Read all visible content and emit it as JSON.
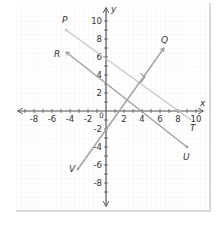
{
  "diagram": {
    "type": "coordinate-plane",
    "axes": {
      "x_label": "x",
      "y_label": "y",
      "x_range": [
        -10,
        10
      ],
      "y_range": [
        -10,
        10
      ],
      "origin_label": "0",
      "x_ticks": [
        "-8",
        "-6",
        "-4",
        "-2",
        "2",
        "4",
        "6",
        "8",
        "10"
      ],
      "y_ticks": [
        "10",
        "8",
        "6",
        "4",
        "2",
        "-2",
        "-4",
        "-6",
        "-8"
      ]
    },
    "lines": [
      {
        "name": "PT",
        "from_label": "P",
        "to_label": "T",
        "from": [
          -4.5,
          9
        ],
        "to": [
          9.5,
          -1
        ],
        "color": "#c8c8c8"
      },
      {
        "name": "RU",
        "from_label": "R",
        "to_label": "U",
        "from": [
          -4.5,
          6.5
        ],
        "to": [
          9,
          -4
        ],
        "color": "#a0a0a0"
      },
      {
        "name": "VQ",
        "from_label": "V",
        "to_label": "Q",
        "from": [
          -4,
          -6
        ],
        "to": [
          6.5,
          7
        ],
        "color": "#a0a0a0"
      }
    ],
    "right_angle_marker": {
      "at": [
        4,
        3.5
      ],
      "between": [
        "PT",
        "VQ"
      ]
    },
    "point_labels": {
      "P": "P",
      "Q": "Q",
      "R": "R",
      "T": "T",
      "U": "U",
      "V": "V"
    }
  }
}
